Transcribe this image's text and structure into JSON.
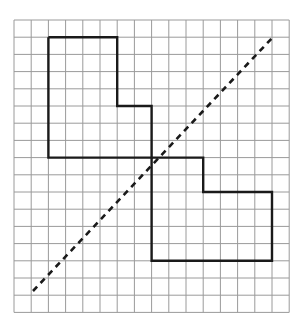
{
  "diagram": {
    "type": "grid-reflection",
    "grid": {
      "x0": 14,
      "y0": 20,
      "cols": 16,
      "rows": 17,
      "cell": 17.2,
      "line_color": "#9a9a9a"
    },
    "shape_top_left": {
      "points_cells": [
        [
          2,
          1
        ],
        [
          6,
          1
        ],
        [
          6,
          5
        ],
        [
          8,
          5
        ],
        [
          8,
          8
        ],
        [
          2,
          8
        ]
      ],
      "stroke": "#1a1a1a"
    },
    "shape_bottom_right": {
      "points_cells": [
        [
          8,
          8
        ],
        [
          11,
          8
        ],
        [
          11,
          10
        ],
        [
          15,
          10
        ],
        [
          15,
          14
        ],
        [
          8,
          14
        ]
      ],
      "stroke": "#1a1a1a"
    },
    "mirror_line": {
      "from": [
        33,
        291
      ],
      "to": [
        273,
        37
      ],
      "style": "dashed",
      "stroke": "#1a1a1a"
    }
  }
}
